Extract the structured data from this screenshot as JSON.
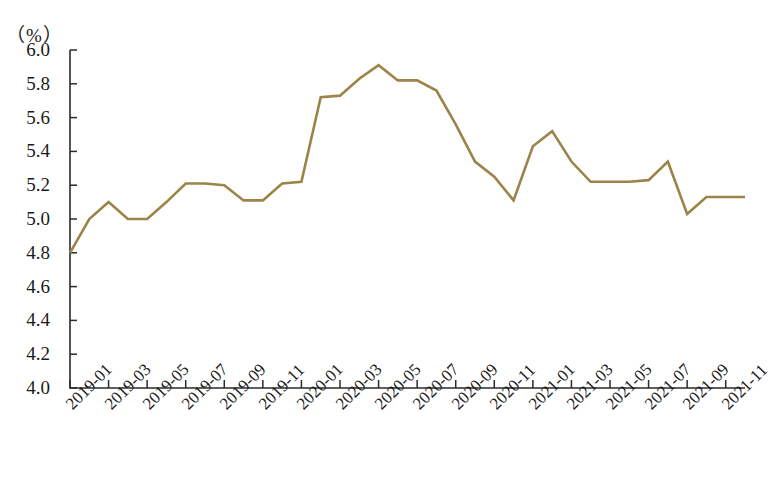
{
  "chart_data": {
    "type": "line",
    "title": "",
    "subtitle": "",
    "xlabel": "",
    "ylabel": "",
    "unit_label": "（%）",
    "ylim": [
      4.0,
      6.0
    ],
    "ytick_step": 0.2,
    "yticks": [
      "6.0",
      "5.8",
      "5.6",
      "5.4",
      "5.2",
      "5.0",
      "4.8",
      "4.6",
      "4.4",
      "4.2",
      "4.0"
    ],
    "grid": false,
    "legend": null,
    "series_color": "#9c8348",
    "axis_color": "#2b2b2b",
    "x": [
      "2019-01",
      "2019-02",
      "2019-03",
      "2019-04",
      "2019-05",
      "2019-06",
      "2019-07",
      "2019-08",
      "2019-09",
      "2019-10",
      "2019-11",
      "2019-12",
      "2020-01",
      "2020-02",
      "2020-03",
      "2020-04",
      "2020-05",
      "2020-06",
      "2020-07",
      "2020-08",
      "2020-09",
      "2020-10",
      "2020-11",
      "2020-12",
      "2021-01",
      "2021-02",
      "2021-03",
      "2021-04",
      "2021-05",
      "2021-06",
      "2021-07",
      "2021-08",
      "2021-09",
      "2021-10",
      "2021-11",
      "2021-12"
    ],
    "xtick_labels": [
      "2019-01",
      "2019-03",
      "2019-05",
      "2019-07",
      "2019-09",
      "2019-11",
      "2020-01",
      "2020-03",
      "2020-05",
      "2020-07",
      "2020-09",
      "2020-11",
      "2021-01",
      "2021-03",
      "2021-05",
      "2021-07",
      "2021-09",
      "2021-11"
    ],
    "series": [
      {
        "name": "城镇调查失业率",
        "values": [
          4.8,
          5.0,
          5.1,
          5.0,
          5.0,
          5.1,
          5.21,
          5.21,
          5.2,
          5.11,
          5.11,
          5.21,
          5.22,
          5.72,
          5.73,
          5.83,
          5.91,
          5.82,
          5.82,
          5.76,
          5.56,
          5.34,
          5.25,
          5.11,
          5.43,
          5.52,
          5.34,
          5.22,
          5.22,
          5.22,
          5.23,
          5.34,
          5.03,
          5.13,
          5.13,
          5.13
        ]
      }
    ]
  }
}
